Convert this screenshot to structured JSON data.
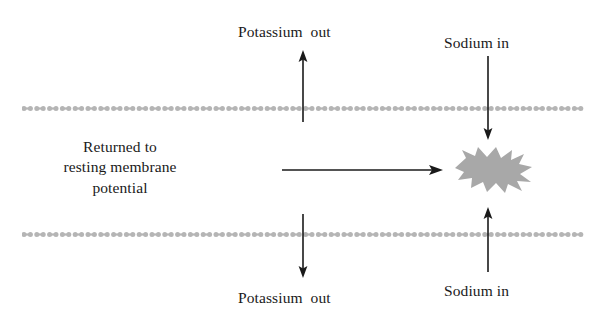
{
  "diagram": {
    "title": "Returned to resting membrane potential",
    "background_color": "#ffffff",
    "ink_color": "#1a1a1a",
    "membrane_color": "#b5b5b5",
    "burst_color": "#a8a8a8"
  },
  "labels": {
    "potassium_out_top": "Potassium  out",
    "sodium_in_top": "Sodium in",
    "potassium_out_bottom": "Potassium  out",
    "sodium_in_bottom": "Sodium in",
    "returned_line1": "Returned to",
    "returned_line2": "resting membrane",
    "returned_line3": "potential"
  },
  "membranes": [
    {
      "name": "upper-membrane",
      "y": 100,
      "x_start": 22,
      "x_end": 596,
      "unit_pitch": 12.8
    },
    {
      "name": "lower-membrane",
      "y": 226,
      "x_start": 22,
      "x_end": 596,
      "unit_pitch": 12.8
    }
  ],
  "arrows": [
    {
      "name": "potassium-out-top-arrow",
      "direction": "up",
      "x": 303,
      "y_tail": 122,
      "y_head": 52
    },
    {
      "name": "sodium-in-top-arrow",
      "direction": "down",
      "x": 488,
      "y_tail": 56,
      "y_head": 138
    },
    {
      "name": "potassium-out-bottom-arrow",
      "direction": "down",
      "x": 303,
      "y_tail": 214,
      "y_head": 277
    },
    {
      "name": "sodium-in-bottom-arrow",
      "direction": "up",
      "x": 488,
      "y_tail": 272,
      "y_head": 209
    },
    {
      "name": "returned-to-potential-arrow",
      "direction": "right",
      "y": 170,
      "x_tail": 282,
      "x_head": 442
    }
  ],
  "burst": {
    "name": "action-potential-burst",
    "center_x": 494,
    "center_y": 169,
    "width": 78,
    "height": 44
  }
}
